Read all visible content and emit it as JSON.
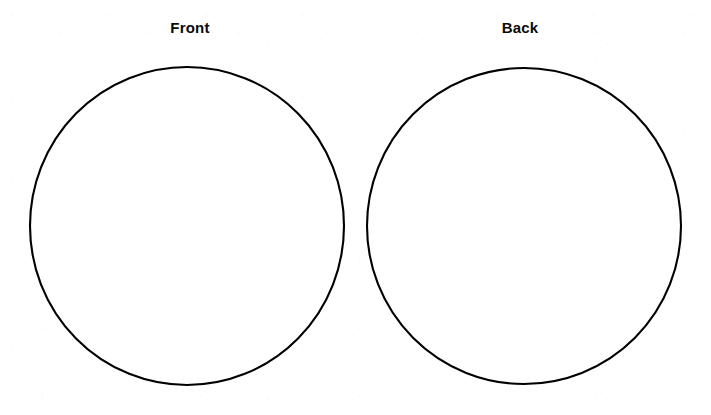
{
  "page": {
    "background_color": "#ffffff",
    "ink_color": "#000000",
    "width": 711,
    "height": 415
  },
  "panels": [
    {
      "id": "front",
      "label": "Front",
      "shape": "circle",
      "center_x": 187,
      "center_y": 225,
      "diameter": 312,
      "stroke_width": 2,
      "stroke_color": "#000000",
      "fill_color": "#ffffff",
      "contents": ""
    },
    {
      "id": "back",
      "label": "Back",
      "shape": "circle",
      "center_x": 524,
      "center_y": 226,
      "diameter": 312,
      "stroke_width": 2,
      "stroke_color": "#000000",
      "fill_color": "#ffffff",
      "contents": ""
    }
  ]
}
